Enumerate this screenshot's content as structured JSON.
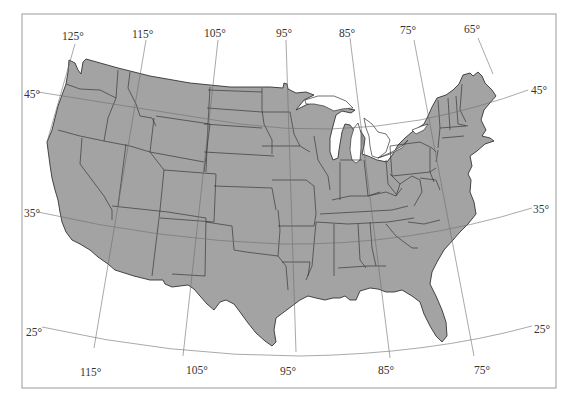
{
  "map": {
    "title": "Contiguous United States with latitude/longitude graticule",
    "colors": {
      "land": "#a3a3a3",
      "border": "#333333",
      "graticule": "#6e6e6e",
      "frame": "#9a9a9a",
      "background": "#ffffff"
    },
    "longitude_labels_top": [
      {
        "label": "125°",
        "x": 62,
        "y": 40
      },
      {
        "label": "115°",
        "x": 132,
        "y": 38
      },
      {
        "label": "105°",
        "x": 204,
        "y": 37
      },
      {
        "label": "95°",
        "x": 276,
        "y": 37
      },
      {
        "label": "85°",
        "x": 339,
        "y": 37
      },
      {
        "label": "75°",
        "x": 400,
        "y": 34
      },
      {
        "label": "65°",
        "x": 464,
        "y": 33
      }
    ],
    "longitude_labels_bottom": [
      {
        "label": "115°",
        "x": 80,
        "y": 376
      },
      {
        "label": "105°",
        "x": 186,
        "y": 374
      },
      {
        "label": "95°",
        "x": 280,
        "y": 375
      },
      {
        "label": "85°",
        "x": 378,
        "y": 374
      },
      {
        "label": "75°",
        "x": 474,
        "y": 374
      }
    ],
    "latitude_labels_left": [
      {
        "label": "45°",
        "x": 24,
        "y": 98
      },
      {
        "label": "35°",
        "x": 24,
        "y": 217
      },
      {
        "label": "25°",
        "x": 26,
        "y": 336
      }
    ],
    "latitude_labels_right": [
      {
        "label": "45°",
        "x": 531,
        "y": 94
      },
      {
        "label": "35°",
        "x": 533,
        "y": 213
      },
      {
        "label": "25°",
        "x": 534,
        "y": 333
      }
    ]
  }
}
